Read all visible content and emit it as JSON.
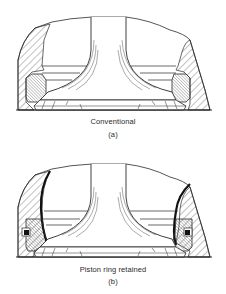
{
  "figure": {
    "colors": {
      "ink": "#2a2a2a",
      "background": "#ffffff"
    },
    "panels": [
      {
        "id": "a",
        "title": "Conventional",
        "label": "(a)"
      },
      {
        "id": "b",
        "title": "Piston ring retained",
        "label": "(b)"
      }
    ]
  }
}
